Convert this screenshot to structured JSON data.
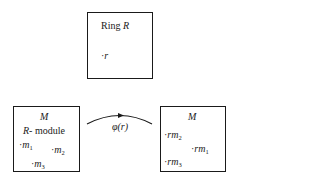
{
  "ring_box": {
    "title_word": "Ring",
    "title_symbol": "R",
    "element": "r"
  },
  "left_module": {
    "title": "M",
    "subtitle_symbol": "R",
    "subtitle_text": "- module",
    "elements": [
      {
        "base": "m",
        "sub": "1"
      },
      {
        "base": "m",
        "sub": "2"
      },
      {
        "base": "m",
        "sub": "3"
      }
    ]
  },
  "arrow": {
    "label": "φ(r)"
  },
  "right_module": {
    "title": "M",
    "elements": [
      {
        "base": "rm",
        "sub": "2"
      },
      {
        "base": "rm",
        "sub": "1"
      },
      {
        "base": "rm",
        "sub": "3"
      }
    ]
  }
}
